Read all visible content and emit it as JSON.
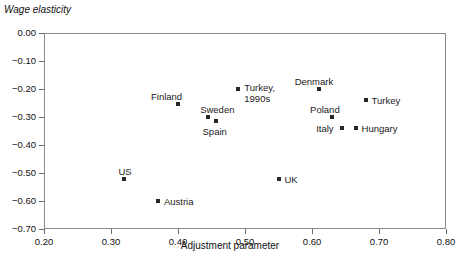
{
  "chart_data": {
    "type": "scatter",
    "title": "",
    "ylabel": "Wage elasticity",
    "xlabel": "Adjustment parameter",
    "xlim": [
      0.2,
      0.8
    ],
    "ylim": [
      -0.7,
      0.0
    ],
    "grid": false,
    "legend": "none",
    "xticks": [
      "0.20",
      "0.30",
      "0.40",
      "0.50",
      "0.60",
      "0.70",
      "0.80"
    ],
    "xtick_values": [
      0.2,
      0.3,
      0.4,
      0.5,
      0.6,
      0.7,
      0.8
    ],
    "yticks": [
      "0.00",
      "-0.10",
      "-0.20",
      "-0.30",
      "-0.40",
      "-0.50",
      "-0.60",
      "-0.70"
    ],
    "ytick_values": [
      0.0,
      -0.1,
      -0.2,
      -0.3,
      -0.4,
      -0.5,
      -0.6,
      -0.7
    ],
    "points": [
      {
        "label": "Finland",
        "x": 0.4,
        "y": -0.255,
        "label_dx": -27,
        "label_dy": -13
      },
      {
        "label": "Sweden",
        "x": 0.445,
        "y": -0.3,
        "label_dx": -8,
        "label_dy": -13
      },
      {
        "label": "Spain",
        "x": 0.456,
        "y": -0.315,
        "label_dx": -13,
        "label_dy": 5
      },
      {
        "label": "Turkey, 1990s",
        "x": 0.49,
        "y": -0.2,
        "label_dx": 6,
        "label_dy": -7,
        "label_line2": "1990s",
        "wrap": true
      },
      {
        "label": "Denmark",
        "x": 0.61,
        "y": -0.2,
        "label_dx": -24,
        "label_dy": -13
      },
      {
        "label": "Turkey",
        "x": 0.68,
        "y": -0.24,
        "label_dx": 6,
        "label_dy": -5
      },
      {
        "label": "Poland",
        "x": 0.63,
        "y": -0.3,
        "label_dx": -22,
        "label_dy": -13
      },
      {
        "label": "Italy",
        "x": 0.645,
        "y": -0.34,
        "label_dx": -26,
        "label_dy": -5
      },
      {
        "label": "Hungary",
        "x": 0.665,
        "y": -0.34,
        "label_dx": 6,
        "label_dy": -5
      },
      {
        "label": "US",
        "x": 0.32,
        "y": -0.52,
        "label_dx": -6,
        "label_dy": -13
      },
      {
        "label": "Austria",
        "x": 0.37,
        "y": -0.6,
        "label_dx": 6,
        "label_dy": -5
      },
      {
        "label": "UK",
        "x": 0.55,
        "y": -0.52,
        "label_dx": 6,
        "label_dy": -5
      }
    ]
  }
}
